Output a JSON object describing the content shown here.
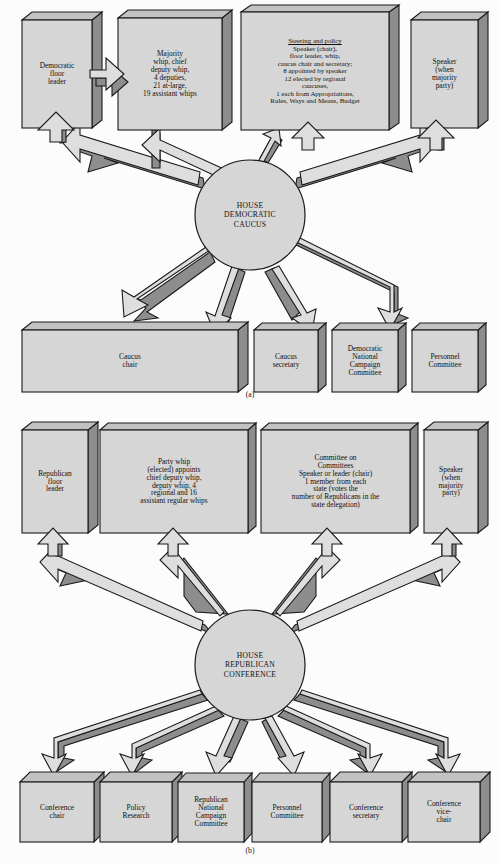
{
  "figure": {
    "panels": [
      {
        "id": "a",
        "label": "(a)",
        "hub": {
          "name": "house-democratic-caucus",
          "text": "HOUSE\nDEMOCRATIC\nCAUCUS"
        },
        "top_boxes": [
          {
            "name": "democratic-floor-leader",
            "text": "Democratic\nfloor\nleader"
          },
          {
            "name": "majority-whip",
            "text": "Majority\nwhip, chief\ndeputy whip,\n4 deputies,\n21 at-large,\n19 assistant whips"
          },
          {
            "name": "steering-and-policy",
            "heading": "Steering and policy",
            "text": "Speaker (chair),\nfloor leader, whip,\ncaucus chair and secretary;\n8 appointed by speaker\n12 elected by regional\ncaucuses,\n1 each from Appropriations,\nRules, Ways and Means, Budget"
          },
          {
            "name": "speaker-when-majority-party",
            "text": "Speaker\n(when\nmajority\nparty)"
          }
        ],
        "bottom_boxes": [
          {
            "name": "caucus-chair",
            "text": "Caucus\nchair"
          },
          {
            "name": "caucus-secretary",
            "text": "Caucus\nsecretary"
          },
          {
            "name": "democratic-national-campaign-committee",
            "text": "Democratic\nNational\nCampaign\nCommittee"
          },
          {
            "name": "personnel-committee",
            "text": "Personnel\nCommittee"
          }
        ]
      },
      {
        "id": "b",
        "label": "(b)",
        "hub": {
          "name": "house-republican-conference",
          "text": "HOUSE\nREPUBLICAN\nCONFERENCE"
        },
        "top_boxes": [
          {
            "name": "republican-floor-leader",
            "text": "Republican\nfloor\nleader"
          },
          {
            "name": "party-whip",
            "text": "Party whip\n(elected) appoints\nchief deputy whip,\ndeputy whip, 4\nregional and 16\nassistant regular whips"
          },
          {
            "name": "committee-on-committees",
            "heading": "Committee on\nCommittees",
            "text": "Speaker or leader (chair)\n1 member from each\nstate (votes the\nnumber of Republicans in the\nstate delegation)"
          },
          {
            "name": "speaker-when-majority-party",
            "text": "Speaker\n(when\nmajority\nparty)"
          }
        ],
        "bottom_boxes": [
          {
            "name": "conference-chair",
            "text": "Conference\nchair"
          },
          {
            "name": "policy-research",
            "text": "Policy\nResearch"
          },
          {
            "name": "republican-national-campaign-committee",
            "text": "Republican\nNational\nCampaign\nCommittee"
          },
          {
            "name": "personnel-committee",
            "text": "Personnel\nCommittee"
          },
          {
            "name": "conference-secretary",
            "text": "Conference\nsecretary"
          },
          {
            "name": "conference-vice-chair",
            "text": "Conference\nvice-\nchair"
          }
        ]
      }
    ],
    "colors": {
      "box_face": "#d6d6d6",
      "box_top": "#c2c2c2",
      "box_side": "#8d8d8d",
      "arrow_face": "#dedede",
      "arrow_shade": "#8d8d8d",
      "outline": "#1a1a1a",
      "background": "#fcfcfc"
    }
  }
}
